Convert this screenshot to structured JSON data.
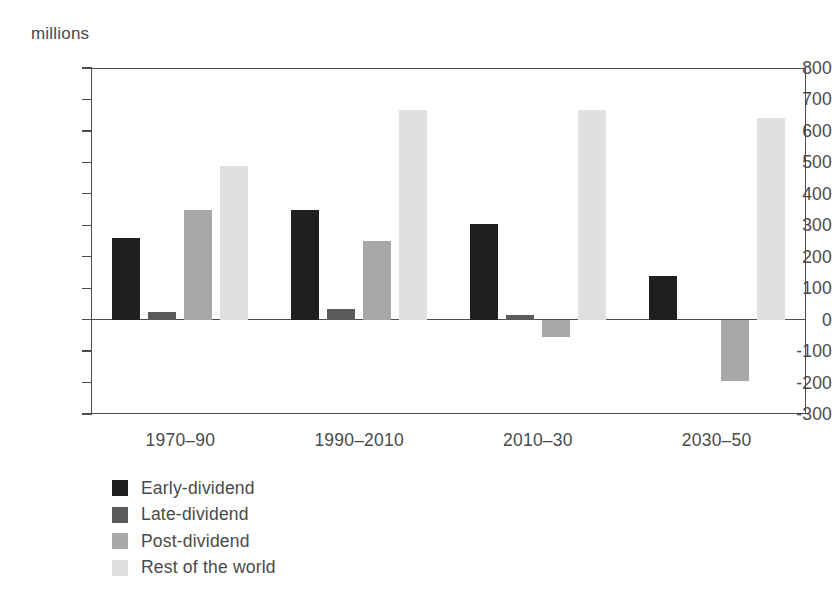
{
  "chart_data": {
    "type": "bar",
    "title": "",
    "subtitle": "",
    "xlabel": "",
    "ylabel": "millions",
    "unit_caption": "millions",
    "ylim": [
      -300,
      800
    ],
    "ytick_step": 100,
    "yticks": [
      800,
      700,
      600,
      500,
      400,
      300,
      200,
      100,
      0,
      -100,
      -200,
      -300
    ],
    "ytick_labels": [
      "800",
      "700",
      "600",
      "500",
      "400",
      "300",
      "200",
      "100",
      "0",
      "-100",
      "-200",
      "-300"
    ],
    "grid": false,
    "zero_line": true,
    "legend_position": "bottom-left",
    "categories": [
      "1970–90",
      "1990–2010",
      "2010–30",
      "2030–50"
    ],
    "series": [
      {
        "name": "Early-dividend",
        "color": "#1f1f1f",
        "values": [
          260,
          350,
          305,
          140
        ]
      },
      {
        "name": "Late-dividend",
        "color": "#5a5a5a",
        "values": [
          25,
          35,
          15,
          0
        ]
      },
      {
        "name": "Post-dividend",
        "color": "#a8a8a8",
        "values": [
          350,
          250,
          -55,
          -195
        ]
      },
      {
        "name": "Rest of the world",
        "color": "#e0e0e0",
        "values": [
          490,
          665,
          665,
          640
        ]
      }
    ]
  },
  "axis": {
    "line_color": "#4d4d4d",
    "text_color": "#4a4a4a"
  }
}
